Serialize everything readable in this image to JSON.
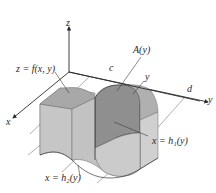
{
  "figure": {
    "axes": {
      "x_label": "x",
      "y_label": "y",
      "z_label": "z"
    },
    "labels": {
      "surface": "z = f(x, y)",
      "cross_section": "A(y)",
      "y_lower_bound": "c",
      "y_variable": "y",
      "y_upper_bound": "d",
      "right_boundary": "x = h₁(y)",
      "left_boundary": "x = h₂(y)"
    },
    "colors": {
      "solid_light": "#c9c9c9",
      "solid_mid": "#b3b3b3",
      "solid_dark": "#9c9c9c",
      "cross_section": "#8f8f8f",
      "line": "#3a3a3a",
      "thin_line": "#707070",
      "background": "#ffffff"
    }
  }
}
